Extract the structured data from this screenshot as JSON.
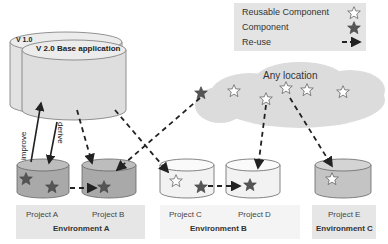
{
  "legend": {
    "reusable_component": "Reusable Component",
    "component": "Component",
    "reuse": "Re-use",
    "icons": {
      "reusable": "hollow-star-icon",
      "component": "filled-star-icon",
      "reuse": "dashed-arrow-icon"
    }
  },
  "base_app": {
    "v1_label": "V 1.0",
    "v2_label": "V 2.0  Base application"
  },
  "arrows": {
    "improve": "improve",
    "derive": "derive"
  },
  "cloud": {
    "label": "Any location"
  },
  "environments": [
    {
      "title": "Environment A",
      "projects": [
        "Project  A",
        "Project  B"
      ]
    },
    {
      "title": "Environment B",
      "projects": [
        "Project  C",
        "Project  D"
      ]
    },
    {
      "title": "Environment C",
      "projects": [
        "Project  E"
      ]
    }
  ],
  "colors": {
    "db_gray": "#a9a9a9",
    "db_light": "#f2f2f2",
    "env_bg": "#e6e6e6",
    "star_dark": "#555555"
  }
}
